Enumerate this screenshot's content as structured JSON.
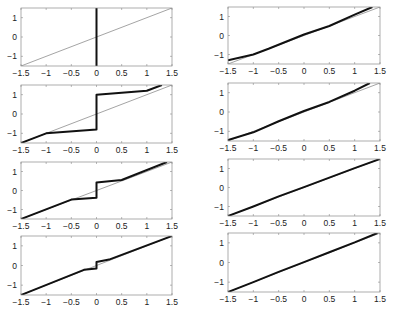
{
  "figure": {
    "layout": {
      "rows": 4,
      "cols": 2
    },
    "colors": {
      "axes": "#8a8a8a",
      "reference_line": "#666666",
      "data_line": "#111111",
      "text": "#222222"
    }
  },
  "chart_data": [
    {
      "type": "line",
      "panel": "left-row-1",
      "box": {
        "x": 21,
        "y": 8,
        "w": 151,
        "h": 58
      },
      "xlim": [
        -1.5,
        1.5
      ],
      "ylim": [
        -1.5,
        1.5
      ],
      "xticks": [
        -1.5,
        -1,
        -0.5,
        0,
        0.5,
        1,
        1.5
      ],
      "xtick_labels": [
        "-1.5",
        "-1",
        "-0.5",
        "0",
        "0.5",
        "1",
        "1.5"
      ],
      "yticks": [
        -1,
        0,
        1
      ],
      "ytick_labels": [
        "-1",
        "0",
        "1"
      ],
      "series": [
        {
          "name": "identity",
          "style": "thin",
          "x": [
            -1.5,
            1.5
          ],
          "y": [
            -1.5,
            1.5
          ]
        },
        {
          "name": "quantizer",
          "style": "thick",
          "x": [
            0,
            0
          ],
          "y": [
            -1.5,
            1.5
          ]
        }
      ]
    },
    {
      "type": "line",
      "panel": "left-row-2",
      "box": {
        "x": 21,
        "y": 85,
        "w": 151,
        "h": 58
      },
      "xlim": [
        -1.5,
        1.5
      ],
      "ylim": [
        -1.5,
        1.5
      ],
      "xticks": [
        -1.5,
        -1,
        -0.5,
        0,
        0.5,
        1,
        1.5
      ],
      "xtick_labels": [
        "-1.5",
        "-1",
        "-0.5",
        "0",
        "0.5",
        "1",
        "1.5"
      ],
      "yticks": [
        -1,
        0,
        1
      ],
      "ytick_labels": [
        "-1",
        "0",
        "1"
      ],
      "series": [
        {
          "name": "identity",
          "style": "thin",
          "x": [
            -1.5,
            1.5
          ],
          "y": [
            -1.5,
            1.5
          ]
        },
        {
          "name": "quantizer",
          "style": "thick",
          "x": [
            -1.5,
            -1,
            0,
            0,
            1,
            1.3
          ],
          "y": [
            -1.5,
            -1,
            -0.8,
            1,
            1.2,
            1.5
          ]
        }
      ]
    },
    {
      "type": "line",
      "panel": "left-row-3",
      "box": {
        "x": 21,
        "y": 162,
        "w": 151,
        "h": 57
      },
      "xlim": [
        -1.5,
        1.5
      ],
      "ylim": [
        -1.5,
        1.5
      ],
      "xticks": [
        -1.5,
        -1,
        -0.5,
        0,
        0.5,
        1,
        1.5
      ],
      "xtick_labels": [
        "-1.5",
        "-1",
        "-0.5",
        "0",
        "0.5",
        "1",
        "1.5"
      ],
      "yticks": [
        -1,
        0,
        1
      ],
      "ytick_labels": [
        "-1",
        "0",
        "1"
      ],
      "series": [
        {
          "name": "identity",
          "style": "thin",
          "x": [
            -1.5,
            1.5
          ],
          "y": [
            -1.5,
            1.5
          ]
        },
        {
          "name": "quantizer",
          "style": "thick",
          "x": [
            -1.5,
            -0.5,
            0,
            0,
            0.5,
            1.4
          ],
          "y": [
            -1.5,
            -0.48,
            -0.38,
            0.42,
            0.55,
            1.5
          ]
        }
      ]
    },
    {
      "type": "line",
      "panel": "left-row-4",
      "box": {
        "x": 21,
        "y": 236,
        "w": 151,
        "h": 59
      },
      "xlim": [
        -1.5,
        1.5
      ],
      "ylim": [
        -1.5,
        1.5
      ],
      "xticks": [
        -1.5,
        -1,
        -0.5,
        0,
        0.5,
        1,
        1.5
      ],
      "xtick_labels": [
        "-1.5",
        "-1",
        "-0.5",
        "0",
        "0.5",
        "1",
        "1.5"
      ],
      "yticks": [
        -1,
        0,
        1
      ],
      "ytick_labels": [
        "-1",
        "0",
        "1"
      ],
      "series": [
        {
          "name": "identity",
          "style": "thin",
          "x": [
            -1.5,
            1.5
          ],
          "y": [
            -1.5,
            1.5
          ]
        },
        {
          "name": "quantizer",
          "style": "thick",
          "x": [
            -1.5,
            -0.25,
            0,
            0,
            0.25,
            1.5
          ],
          "y": [
            -1.5,
            -0.22,
            -0.15,
            0.18,
            0.3,
            1.5
          ]
        }
      ]
    },
    {
      "type": "line",
      "panel": "right-row-1",
      "box": {
        "x": 228,
        "y": 7,
        "w": 152,
        "h": 57
      },
      "xlim": [
        -1.5,
        1.5
      ],
      "ylim": [
        -1.5,
        1.5
      ],
      "xticks": [
        -1.5,
        -1,
        -0.5,
        0,
        0.5,
        1,
        1.5
      ],
      "xtick_labels": [
        "-1.5",
        "-1",
        "-0.5",
        "0",
        "0.5",
        "1",
        "1.5"
      ],
      "yticks": [
        -1,
        0,
        1
      ],
      "ytick_labels": [
        "-1",
        "0",
        "1"
      ],
      "series": [
        {
          "name": "identity",
          "style": "thin",
          "x": [
            -1.5,
            1.5
          ],
          "y": [
            -1.5,
            1.5
          ]
        },
        {
          "name": "quantizer",
          "style": "thick",
          "x": [
            -1.5,
            -1,
            -0.7,
            0,
            0.5,
            1,
            1.35
          ],
          "y": [
            -1.3,
            -1.0,
            -0.7,
            0.05,
            0.5,
            1.1,
            1.5
          ]
        }
      ]
    },
    {
      "type": "line",
      "panel": "right-row-2",
      "box": {
        "x": 228,
        "y": 83,
        "w": 152,
        "h": 58
      },
      "xlim": [
        -1.5,
        1.5
      ],
      "ylim": [
        -1.5,
        1.5
      ],
      "xticks": [
        -1.5,
        -1,
        -0.5,
        0,
        0.5,
        1,
        1.5
      ],
      "xtick_labels": [
        "-1.5",
        "-1",
        "-0.5",
        "0",
        "0.5",
        "1",
        "1.5"
      ],
      "yticks": [
        -1,
        0,
        1
      ],
      "ytick_labels": [
        "-1",
        "0",
        "1"
      ],
      "series": [
        {
          "name": "identity",
          "style": "thin",
          "x": [
            -1.5,
            1.5
          ],
          "y": [
            -1.5,
            1.5
          ]
        },
        {
          "name": "quantizer",
          "style": "thick",
          "x": [
            -1.5,
            -1,
            -0.5,
            0,
            0.5,
            1,
            1.3
          ],
          "y": [
            -1.45,
            -1.05,
            -0.48,
            0.05,
            0.52,
            1.1,
            1.5
          ]
        }
      ]
    },
    {
      "type": "line",
      "panel": "right-row-3",
      "box": {
        "x": 228,
        "y": 159,
        "w": 152,
        "h": 57
      },
      "xlim": [
        -1.5,
        1.5
      ],
      "ylim": [
        -1.5,
        1.5
      ],
      "xticks": [
        -1.5,
        -1,
        -0.5,
        0,
        0.5,
        1,
        1.5
      ],
      "xtick_labels": [
        "-1.5",
        "-1",
        "-0.5",
        "0",
        "0.5",
        "1",
        "1.5"
      ],
      "yticks": [
        -1,
        0,
        1
      ],
      "ytick_labels": [
        "-1",
        "0",
        "1"
      ],
      "series": [
        {
          "name": "identity",
          "style": "thin",
          "x": [
            -1.5,
            1.5
          ],
          "y": [
            -1.5,
            1.5
          ]
        },
        {
          "name": "quantizer",
          "style": "thick",
          "x": [
            -1.5,
            -1,
            -0.5,
            0,
            0.5,
            1,
            1.5
          ],
          "y": [
            -1.5,
            -1.0,
            -0.47,
            0.02,
            0.52,
            1.02,
            1.5
          ]
        }
      ]
    },
    {
      "type": "line",
      "panel": "right-row-4",
      "box": {
        "x": 228,
        "y": 233,
        "w": 152,
        "h": 59
      },
      "xlim": [
        -1.5,
        1.5
      ],
      "ylim": [
        -1.5,
        1.5
      ],
      "xticks": [
        -1.5,
        -1,
        -0.5,
        0,
        0.5,
        1,
        1.5
      ],
      "xtick_labels": [
        "-1.5",
        "-1",
        "-0.5",
        "0",
        "0.5",
        "1",
        "1.5"
      ],
      "yticks": [
        -1,
        0,
        1
      ],
      "ytick_labels": [
        "-1",
        "0",
        "1"
      ],
      "series": [
        {
          "name": "identity",
          "style": "thin",
          "x": [
            -1.5,
            1.5
          ],
          "y": [
            -1.5,
            1.5
          ]
        },
        {
          "name": "quantizer",
          "style": "thick",
          "x": [
            -1.5,
            -1,
            -0.5,
            0,
            0.5,
            1,
            1.45
          ],
          "y": [
            -1.5,
            -1.0,
            -0.48,
            0.02,
            0.52,
            1.02,
            1.5
          ]
        }
      ]
    }
  ]
}
